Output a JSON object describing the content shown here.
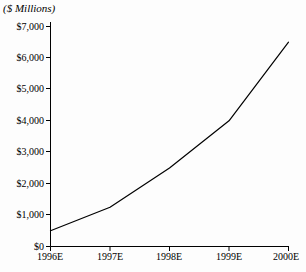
{
  "chart_data": {
    "type": "line",
    "title": "",
    "subtitle": "",
    "unit_label": "($ Millions)",
    "xlabel": "",
    "ylabel": "",
    "categories": [
      "1996E",
      "1997E",
      "1998E",
      "1999E",
      "2000E"
    ],
    "values": [
      500,
      1250,
      2500,
      4000,
      6500
    ],
    "series": [
      {
        "name": "Revenue",
        "values": [
          500,
          1250,
          2500,
          4000,
          6500
        ]
      }
    ],
    "ylim": [
      0,
      7000
    ],
    "y_ticks": [
      0,
      1000,
      2000,
      3000,
      4000,
      5000,
      6000,
      7000
    ],
    "y_tick_labels": [
      "$0",
      "$1,000",
      "$2,000",
      "$3,000",
      "$4,000",
      "$5,000",
      "$6,000",
      "$7,000"
    ],
    "x_tick_labels": [
      "1996E",
      "1997E",
      "1998E",
      "1999E",
      "2000E"
    ],
    "grid": false,
    "legend": false,
    "legend_position": "none",
    "line_color": "#000000",
    "background_color": "#fdfdfd",
    "axis_color": "#000000"
  }
}
